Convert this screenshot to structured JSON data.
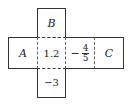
{
  "diagram": {
    "type": "cube-net",
    "faces": {
      "top": {
        "label": "B",
        "style": "italic"
      },
      "left": {
        "label": "A",
        "style": "italic"
      },
      "center": {
        "label": "1.2"
      },
      "right_inner": {
        "sign": "−",
        "numerator": "4",
        "denominator": "5"
      },
      "far_right": {
        "label": "C",
        "style": "italic"
      },
      "bottom": {
        "label": "−3"
      }
    }
  }
}
